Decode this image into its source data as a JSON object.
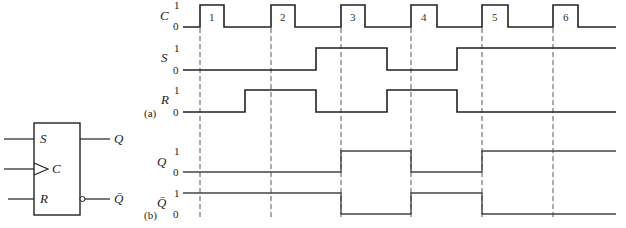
{
  "flipflop": {
    "inputs": [
      "S",
      "C",
      "R"
    ],
    "outputs": [
      "Q",
      "Q̄"
    ]
  },
  "part_labels": {
    "a": "(a)",
    "b": "(b)"
  },
  "level_labels": {
    "high": "1",
    "low": "0"
  },
  "signals": {
    "C": {
      "label": "C",
      "pulses": [
        "1",
        "2",
        "3",
        "4",
        "5",
        "6"
      ]
    },
    "S": {
      "label": "S"
    },
    "R": {
      "label": "R"
    },
    "Q": {
      "label": "Q"
    },
    "Qbar": {
      "label": "Q̄"
    }
  },
  "colors": {
    "stroke": "#222222",
    "background": "#ffffff"
  }
}
